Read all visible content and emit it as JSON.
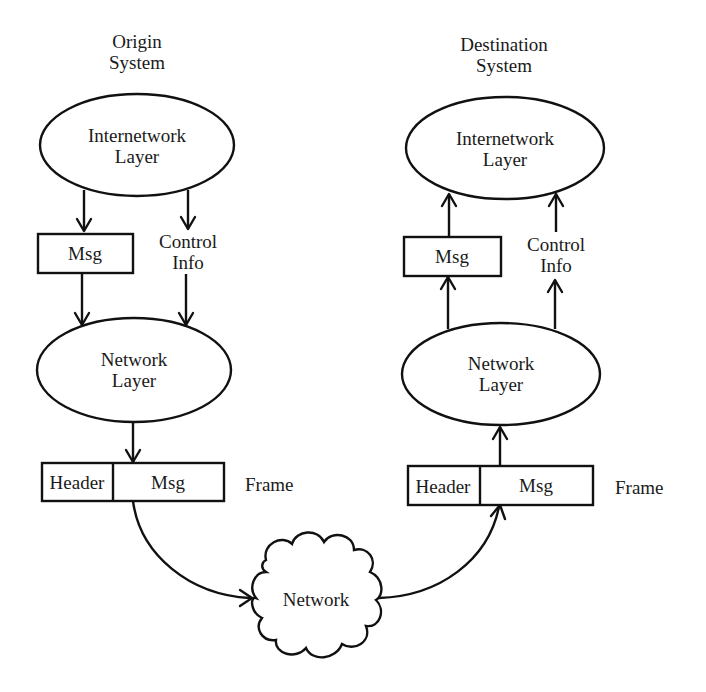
{
  "diagram": {
    "type": "protocol-layer-flow",
    "colors": {
      "stroke": "#111111",
      "text": "#1a1a1a",
      "background": "#ffffff"
    },
    "origin": {
      "title_line1": "Origin",
      "title_line2": "System",
      "internetwork_layer": {
        "line1": "Internetwork",
        "line2": "Layer"
      },
      "msg_box": "Msg",
      "control_info": {
        "line1": "Control",
        "line2": "Info"
      },
      "network_layer": {
        "line1": "Network",
        "line2": "Layer"
      },
      "frame": {
        "header": "Header",
        "msg": "Msg",
        "label": "Frame"
      }
    },
    "destination": {
      "title_line1": "Destination",
      "title_line2": "System",
      "internetwork_layer": {
        "line1": "Internetwork",
        "line2": "Layer"
      },
      "msg_box": "Msg",
      "control_info": {
        "line1": "Control",
        "line2": "Info"
      },
      "network_layer": {
        "line1": "Network",
        "line2": "Layer"
      },
      "frame": {
        "header": "Header",
        "msg": "Msg",
        "label": "Frame"
      }
    },
    "network_cloud": {
      "label": "Network"
    },
    "edges": [
      {
        "from": "origin.internetwork_layer",
        "to": "origin.msg_box",
        "direction": "down"
      },
      {
        "from": "origin.internetwork_layer",
        "to": "origin.control_info",
        "direction": "down"
      },
      {
        "from": "origin.msg_box",
        "to": "origin.network_layer",
        "direction": "down"
      },
      {
        "from": "origin.control_info",
        "to": "origin.network_layer",
        "direction": "down"
      },
      {
        "from": "origin.network_layer",
        "to": "origin.frame",
        "direction": "down"
      },
      {
        "from": "origin.frame",
        "to": "network_cloud",
        "direction": "curve"
      },
      {
        "from": "network_cloud",
        "to": "destination.frame",
        "direction": "curve"
      },
      {
        "from": "destination.frame",
        "to": "destination.network_layer",
        "direction": "up"
      },
      {
        "from": "destination.network_layer",
        "to": "destination.msg_box",
        "direction": "up"
      },
      {
        "from": "destination.network_layer",
        "to": "destination.control_info",
        "direction": "up"
      },
      {
        "from": "destination.msg_box",
        "to": "destination.internetwork_layer",
        "direction": "up"
      },
      {
        "from": "destination.control_info",
        "to": "destination.internetwork_layer",
        "direction": "up"
      }
    ]
  }
}
